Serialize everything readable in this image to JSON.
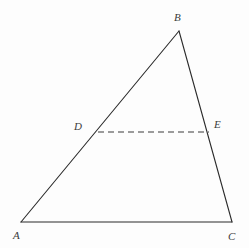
{
  "figure": {
    "kind": "geometry-diagram",
    "background_color": "#fdfdfd",
    "stroke_color": "#2a2a2a",
    "dash_stroke_color": "#3a3a3a",
    "label_color": "#3b3b3b",
    "stroke_width": 1.1,
    "dash_pattern": "6,4"
  },
  "points": [
    {
      "id": "A",
      "label": "A",
      "x": 21,
      "y": 222,
      "label_x": 13,
      "label_y": 230
    },
    {
      "id": "B",
      "label": "B",
      "x": 179,
      "y": 31,
      "label_x": 174,
      "label_y": 12
    },
    {
      "id": "C",
      "label": "C",
      "x": 232,
      "y": 222,
      "label_x": 228,
      "label_y": 231
    },
    {
      "id": "D",
      "label": "D",
      "x": 98,
      "y": 132,
      "label_x": 74,
      "label_y": 121
    },
    {
      "id": "E",
      "label": "E",
      "x": 209,
      "y": 132,
      "label_x": 214,
      "label_y": 119
    }
  ],
  "segments": [
    {
      "id": "AB",
      "from": "A",
      "to": "B",
      "style": "solid"
    },
    {
      "id": "BC",
      "from": "B",
      "to": "C",
      "style": "solid"
    },
    {
      "id": "AC",
      "from": "A",
      "to": "C",
      "style": "solid"
    },
    {
      "id": "DE",
      "from": "D",
      "to": "E",
      "style": "dashed"
    }
  ],
  "labels": {
    "A": "A",
    "B": "B",
    "C": "C",
    "D": "D",
    "E": "E"
  }
}
